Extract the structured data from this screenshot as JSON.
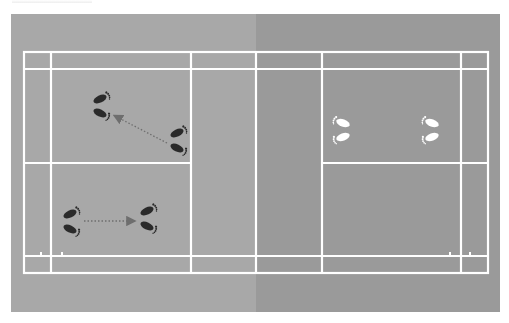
{
  "diagram": {
    "type": "badminton-court-footwork",
    "colors": {
      "left_half": "#a8a8a8",
      "right_half": "#9a9a9a",
      "court_lines": "#ffffff",
      "dark_footprints": "#2a2a2a",
      "light_footprints": "#ffffff",
      "arrows": "#6e6e6e"
    },
    "footprints": [
      {
        "id": "left-upper-target",
        "side": "left",
        "color": "dark",
        "x": 102,
        "y": 106,
        "facing": "right"
      },
      {
        "id": "left-upper-start",
        "side": "left",
        "color": "dark",
        "x": 179,
        "y": 140,
        "facing": "right"
      },
      {
        "id": "left-lower-start",
        "side": "left",
        "color": "dark",
        "x": 72,
        "y": 221,
        "facing": "right"
      },
      {
        "id": "left-lower-target",
        "side": "left",
        "color": "dark",
        "x": 149,
        "y": 219,
        "facing": "right"
      },
      {
        "id": "right-front",
        "side": "right",
        "color": "light",
        "x": 341,
        "y": 130,
        "facing": "left"
      },
      {
        "id": "right-back",
        "side": "right",
        "color": "light",
        "x": 430,
        "y": 130,
        "facing": "left"
      }
    ],
    "arrows": [
      {
        "id": "diagonal-move",
        "from": [
          167,
          143
        ],
        "to": [
          113,
          115
        ],
        "style": "dotted"
      },
      {
        "id": "forward-move",
        "from": [
          84,
          221
        ],
        "to": [
          136,
          221
        ],
        "style": "dotted"
      }
    ]
  }
}
